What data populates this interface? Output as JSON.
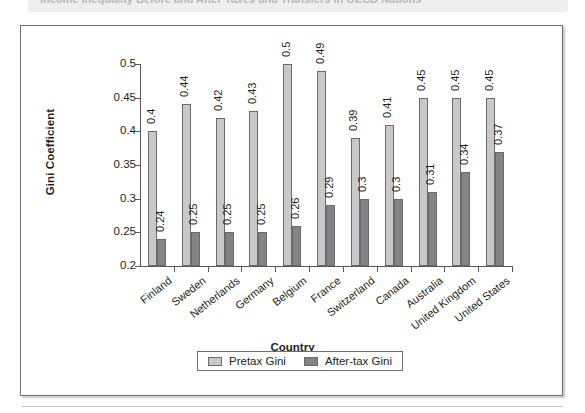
{
  "caption": {
    "text": "Income Inequality Before and After Taxes and Transfers in OECD Nations",
    "bullet_icon": "figure-marker-icon"
  },
  "chart_data": {
    "type": "bar",
    "title": "",
    "xlabel": "Country",
    "ylabel": "Gini Coefficient",
    "ylim": [
      0.2,
      0.5
    ],
    "yticks": [
      "0.2",
      "0.25",
      "0.3",
      "0.35",
      "0.4",
      "0.45",
      "0.5"
    ],
    "grid": false,
    "legend_position": "bottom",
    "categories": [
      "Finland",
      "Sweden",
      "Netherlands",
      "Germany",
      "Belgium",
      "France",
      "Switzerland",
      "Canada",
      "Australia",
      "United Kingdom",
      "United States"
    ],
    "series": [
      {
        "name": "Pretax Gini",
        "color": "#c9c9c9",
        "values": [
          0.4,
          0.44,
          0.42,
          0.43,
          0.5,
          0.49,
          0.39,
          0.41,
          0.45,
          0.45,
          0.45
        ],
        "labels": [
          "0.4",
          "0.44",
          "0.42",
          "0.43",
          "0.5",
          "0.49",
          "0.39",
          "0.41",
          "0.45",
          "0.45",
          "0.45"
        ]
      },
      {
        "name": "After-tax Gini",
        "color": "#848487",
        "values": [
          0.24,
          0.25,
          0.25,
          0.25,
          0.26,
          0.29,
          0.3,
          0.3,
          0.31,
          0.34,
          0.37
        ],
        "labels": [
          "0.24",
          "0.25",
          "0.25",
          "0.25",
          "0.26",
          "0.29",
          "0.3",
          "0.3",
          "0.31",
          "0.34",
          "0.37"
        ]
      }
    ]
  }
}
